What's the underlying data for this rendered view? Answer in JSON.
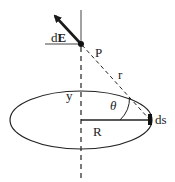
{
  "diagram": {
    "labels": {
      "field_d": "d",
      "field_E": "E",
      "point": "P",
      "distance": "r",
      "height": "y",
      "angle": "θ",
      "radius": "R",
      "element": "ds"
    },
    "colors": {
      "stroke": "#1a1a1a",
      "background": "#ffffff"
    }
  }
}
